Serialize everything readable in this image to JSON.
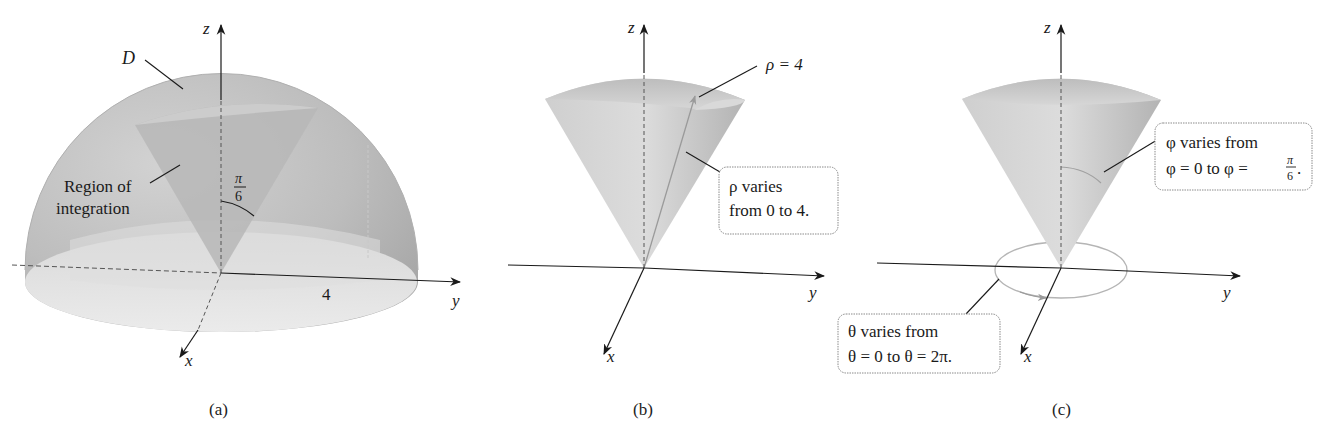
{
  "figure": {
    "panels": [
      {
        "id": "a",
        "caption": "(a)",
        "axes": {
          "z": "z",
          "y": "y",
          "x": "x"
        },
        "labels": {
          "solid": "D",
          "region_line1": "Region of",
          "region_line2": "integration",
          "angle_num": "π",
          "angle_den": "6",
          "radius": "4"
        }
      },
      {
        "id": "b",
        "caption": "(b)",
        "axes": {
          "z": "z",
          "y": "y",
          "x": "x"
        },
        "labels": {
          "rho_eq": "ρ = 4",
          "box_line1": "ρ varies",
          "box_line2": "from 0 to 4."
        }
      },
      {
        "id": "c",
        "caption": "(c)",
        "axes": {
          "z": "z",
          "y": "y",
          "x": "x"
        },
        "labels": {
          "phi_line1": "φ varies from",
          "phi_line2": "φ = 0 to φ =",
          "phi_frac_num": "π",
          "phi_frac_den": "6",
          "phi_period": ".",
          "theta_line1": "θ varies from",
          "theta_line2": "θ = 0 to θ = 2π."
        }
      }
    ],
    "colors": {
      "solid_dark": "#a9a9a9",
      "solid_mid": "#c8c8c8",
      "solid_light": "#e6e6e6",
      "axis": "#1a1a1a",
      "guide": "#9a9a9a"
    }
  }
}
